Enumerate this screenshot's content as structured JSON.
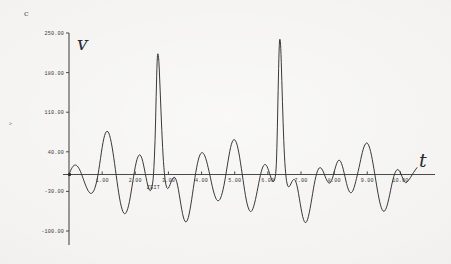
{
  "figure": {
    "corner_label": "c",
    "side_label": "v",
    "y_axis_symbol": "ᴠ",
    "x_axis_symbol": "t",
    "x_caption": "ZEIT"
  },
  "chart_data": {
    "type": "line",
    "title": "",
    "subtitle": "",
    "xlabel": "ZEIT",
    "ylabel": "v",
    "x_axis_symbol": "t",
    "y_axis_symbol": "v",
    "grid": false,
    "legend": "none",
    "xlim": [
      0.0,
      10.5
    ],
    "ylim": [
      -100.0,
      250.0
    ],
    "xticks": [
      1.0,
      2.0,
      3.0,
      4.0,
      5.0,
      6.0,
      7.0,
      8.0,
      9.0,
      10.0
    ],
    "xtick_labels": [
      "1.00",
      "2.00",
      "3.00",
      "4.00",
      "5.00",
      "6.00",
      "7.00",
      "8.00",
      "9.00",
      "10.00"
    ],
    "yticks": [
      -100.0,
      -30.0,
      40.0,
      110.0,
      180.0,
      250.0
    ],
    "ytick_labels": [
      "-100.00",
      "-30.00",
      "40.00",
      "110.00",
      "180.00",
      "250.00"
    ],
    "series": [
      {
        "name": "v(t)",
        "color": "#2e2e2e",
        "description": "Amplitudenmodulierte Schwingung (Schwebung) mit zwei ausgepraegten Resonanzspitzen",
        "points": [
          [
            0.0,
            0.0
          ],
          [
            0.05,
            7.0
          ],
          [
            0.1,
            13.0
          ],
          [
            0.15,
            16.0
          ],
          [
            0.2,
            17.0
          ],
          [
            0.25,
            15.0
          ],
          [
            0.3,
            11.0
          ],
          [
            0.35,
            5.0
          ],
          [
            0.4,
            -3.0
          ],
          [
            0.45,
            -11.0
          ],
          [
            0.5,
            -19.0
          ],
          [
            0.55,
            -26.0
          ],
          [
            0.6,
            -31.0
          ],
          [
            0.65,
            -34.0
          ],
          [
            0.7,
            -33.0
          ],
          [
            0.75,
            -29.0
          ],
          [
            0.8,
            -21.0
          ],
          [
            0.85,
            -9.0
          ],
          [
            0.9,
            8.0
          ],
          [
            0.95,
            28.0
          ],
          [
            1.0,
            48.0
          ],
          [
            1.05,
            64.0
          ],
          [
            1.1,
            74.0
          ],
          [
            1.15,
            77.0
          ],
          [
            1.2,
            74.0
          ],
          [
            1.25,
            64.0
          ],
          [
            1.3,
            49.0
          ],
          [
            1.35,
            30.0
          ],
          [
            1.4,
            9.0
          ],
          [
            1.45,
            -13.0
          ],
          [
            1.5,
            -33.0
          ],
          [
            1.55,
            -50.0
          ],
          [
            1.6,
            -62.0
          ],
          [
            1.65,
            -69.0
          ],
          [
            1.7,
            -70.0
          ],
          [
            1.75,
            -65.0
          ],
          [
            1.8,
            -55.0
          ],
          [
            1.85,
            -40.0
          ],
          [
            1.9,
            -22.0
          ],
          [
            1.95,
            -3.0
          ],
          [
            2.0,
            14.0
          ],
          [
            2.05,
            27.0
          ],
          [
            2.1,
            34.0
          ],
          [
            2.15,
            35.0
          ],
          [
            2.2,
            29.0
          ],
          [
            2.25,
            17.0
          ],
          [
            2.3,
            2.0
          ],
          [
            2.35,
            -13.0
          ],
          [
            2.4,
            -25.0
          ],
          [
            2.45,
            -30.0
          ],
          [
            2.5,
            -25.0
          ],
          [
            2.55,
            -5.0
          ],
          [
            2.6,
            60.0
          ],
          [
            2.63,
            140.0
          ],
          [
            2.66,
            205.0
          ],
          [
            2.68,
            216.0
          ],
          [
            2.71,
            205.0
          ],
          [
            2.75,
            150.0
          ],
          [
            2.8,
            75.0
          ],
          [
            2.85,
            20.0
          ],
          [
            2.9,
            -12.0
          ],
          [
            2.95,
            -25.0
          ],
          [
            3.0,
            -25.0
          ],
          [
            3.05,
            -18.0
          ],
          [
            3.1,
            -10.0
          ],
          [
            3.15,
            -5.0
          ],
          [
            3.2,
            -5.0
          ],
          [
            3.25,
            -12.0
          ],
          [
            3.3,
            -26.0
          ],
          [
            3.35,
            -44.0
          ],
          [
            3.4,
            -62.0
          ],
          [
            3.45,
            -76.0
          ],
          [
            3.5,
            -84.0
          ],
          [
            3.55,
            -84.0
          ],
          [
            3.6,
            -77.0
          ],
          [
            3.65,
            -63.0
          ],
          [
            3.7,
            -45.0
          ],
          [
            3.75,
            -25.0
          ],
          [
            3.8,
            -5.0
          ],
          [
            3.85,
            12.0
          ],
          [
            3.9,
            26.0
          ],
          [
            3.95,
            35.0
          ],
          [
            4.0,
            39.0
          ],
          [
            4.05,
            38.0
          ],
          [
            4.1,
            33.0
          ],
          [
            4.15,
            24.0
          ],
          [
            4.2,
            12.0
          ],
          [
            4.25,
            -1.0
          ],
          [
            4.3,
            -15.0
          ],
          [
            4.35,
            -28.0
          ],
          [
            4.4,
            -38.0
          ],
          [
            4.45,
            -45.0
          ],
          [
            4.5,
            -47.0
          ],
          [
            4.55,
            -45.0
          ],
          [
            4.6,
            -38.0
          ],
          [
            4.65,
            -27.0
          ],
          [
            4.7,
            -12.0
          ],
          [
            4.75,
            6.0
          ],
          [
            4.8,
            24.0
          ],
          [
            4.85,
            41.0
          ],
          [
            4.9,
            54.0
          ],
          [
            4.95,
            61.0
          ],
          [
            5.0,
            62.0
          ],
          [
            5.05,
            57.0
          ],
          [
            5.1,
            46.0
          ],
          [
            5.15,
            30.0
          ],
          [
            5.2,
            11.0
          ],
          [
            5.25,
            -9.0
          ],
          [
            5.3,
            -29.0
          ],
          [
            5.35,
            -46.0
          ],
          [
            5.4,
            -58.0
          ],
          [
            5.45,
            -65.0
          ],
          [
            5.5,
            -66.0
          ],
          [
            5.55,
            -61.0
          ],
          [
            5.6,
            -51.0
          ],
          [
            5.65,
            -38.0
          ],
          [
            5.7,
            -23.0
          ],
          [
            5.75,
            -8.0
          ],
          [
            5.8,
            5.0
          ],
          [
            5.85,
            14.0
          ],
          [
            5.9,
            18.0
          ],
          [
            5.95,
            17.0
          ],
          [
            6.0,
            11.0
          ],
          [
            6.05,
            2.0
          ],
          [
            6.1,
            -7.0
          ],
          [
            6.15,
            -13.0
          ],
          [
            6.2,
            -12.0
          ],
          [
            6.25,
            5.0
          ],
          [
            6.28,
            60.0
          ],
          [
            6.31,
            150.0
          ],
          [
            6.34,
            225.0
          ],
          [
            6.36,
            243.0
          ],
          [
            6.39,
            228.0
          ],
          [
            6.42,
            168.0
          ],
          [
            6.46,
            90.0
          ],
          [
            6.5,
            30.0
          ],
          [
            6.55,
            -8.0
          ],
          [
            6.6,
            -22.0
          ],
          [
            6.65,
            -22.0
          ],
          [
            6.7,
            -16.0
          ],
          [
            6.75,
            -10.0
          ],
          [
            6.8,
            -8.0
          ],
          [
            6.85,
            -13.0
          ],
          [
            6.9,
            -25.0
          ],
          [
            6.95,
            -42.0
          ],
          [
            7.0,
            -60.0
          ],
          [
            7.05,
            -75.0
          ],
          [
            7.1,
            -84.0
          ],
          [
            7.15,
            -86.0
          ],
          [
            7.2,
            -80.0
          ],
          [
            7.25,
            -68.0
          ],
          [
            7.3,
            -52.0
          ],
          [
            7.35,
            -34.0
          ],
          [
            7.4,
            -17.0
          ],
          [
            7.45,
            -3.0
          ],
          [
            7.5,
            7.0
          ],
          [
            7.55,
            12.0
          ],
          [
            7.6,
            12.0
          ],
          [
            7.65,
            8.0
          ],
          [
            7.7,
            1.0
          ],
          [
            7.75,
            -7.0
          ],
          [
            7.8,
            -13.0
          ],
          [
            7.85,
            -16.0
          ],
          [
            7.9,
            -14.0
          ],
          [
            7.95,
            -7.0
          ],
          [
            8.0,
            4.0
          ],
          [
            8.05,
            15.0
          ],
          [
            8.1,
            23.0
          ],
          [
            8.15,
            26.0
          ],
          [
            8.2,
            23.0
          ],
          [
            8.25,
            15.0
          ],
          [
            8.3,
            3.0
          ],
          [
            8.35,
            -10.0
          ],
          [
            8.4,
            -22.0
          ],
          [
            8.45,
            -30.0
          ],
          [
            8.5,
            -33.0
          ],
          [
            8.55,
            -31.0
          ],
          [
            8.6,
            -24.0
          ],
          [
            8.65,
            -13.0
          ],
          [
            8.7,
            -1.0
          ],
          [
            8.75,
            12.0
          ],
          [
            8.8,
            26.0
          ],
          [
            8.85,
            39.0
          ],
          [
            8.9,
            49.0
          ],
          [
            8.95,
            55.0
          ],
          [
            9.0,
            56.0
          ],
          [
            9.05,
            51.0
          ],
          [
            9.1,
            41.0
          ],
          [
            9.15,
            27.0
          ],
          [
            9.2,
            10.0
          ],
          [
            9.25,
            -8.0
          ],
          [
            9.3,
            -26.0
          ],
          [
            9.35,
            -42.0
          ],
          [
            9.4,
            -55.0
          ],
          [
            9.45,
            -63.0
          ],
          [
            9.5,
            -66.0
          ],
          [
            9.55,
            -63.0
          ],
          [
            9.6,
            -55.0
          ],
          [
            9.65,
            -43.0
          ],
          [
            9.7,
            -29.0
          ],
          [
            9.75,
            -15.0
          ],
          [
            9.8,
            -3.0
          ],
          [
            9.85,
            5.0
          ],
          [
            9.9,
            9.0
          ],
          [
            9.95,
            8.0
          ],
          [
            10.0,
            3.0
          ],
          [
            10.05,
            -4.0
          ],
          [
            10.1,
            -11.0
          ],
          [
            10.15,
            -15.0
          ],
          [
            10.2,
            -14.0
          ],
          [
            10.3,
            -6.0
          ],
          [
            10.4,
            4.0
          ],
          [
            10.5,
            12.0
          ]
        ]
      }
    ]
  },
  "colors": {
    "paper": "#f2f1ef",
    "ink": "#2e2e2e",
    "axis": "#4a4a4a"
  }
}
